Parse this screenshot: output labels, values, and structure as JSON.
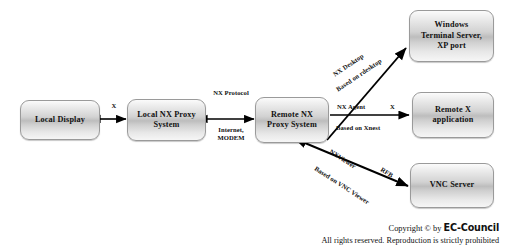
{
  "diagram": {
    "nodes": [
      {
        "id": "local-display",
        "lines": [
          "Local Display"
        ]
      },
      {
        "id": "local-nx-proxy",
        "lines": [
          "Local NX Proxy",
          "System"
        ]
      },
      {
        "id": "remote-nx-proxy",
        "lines": [
          "Remote NX",
          "Proxy System"
        ]
      },
      {
        "id": "windows-terminal",
        "lines": [
          "Windows",
          "Terminal Server,",
          "XP port"
        ]
      },
      {
        "id": "remote-x-app",
        "lines": [
          "Remote X",
          "application"
        ]
      },
      {
        "id": "vnc-server",
        "lines": [
          "VNC Server"
        ]
      }
    ],
    "edge_labels": {
      "x_link": "X",
      "nx_protocol": "NX Protocol",
      "internet_modem": "Internet, MODEM",
      "nx_desktop": "NX Desktop",
      "based_on_rdesktop": "Based on rdesktop",
      "nx_agent": "NX Agent",
      "x_agent": "X",
      "based_on_xnest": "Based on Xnest",
      "nx_viewer": "NXViewer",
      "rfb": "RFB",
      "based_on_vnc_viewer": "Based on VNC Viewer"
    }
  },
  "footer": {
    "copyright_prefix": "Copyright © by",
    "brand": "EC-Council",
    "rights": "All rights reserved. Reproduction is strictly prohibited"
  },
  "colors": {
    "background": "#ffffff",
    "node_border": "#9a9a9a",
    "text": "#111111",
    "arrow": "#000000"
  }
}
